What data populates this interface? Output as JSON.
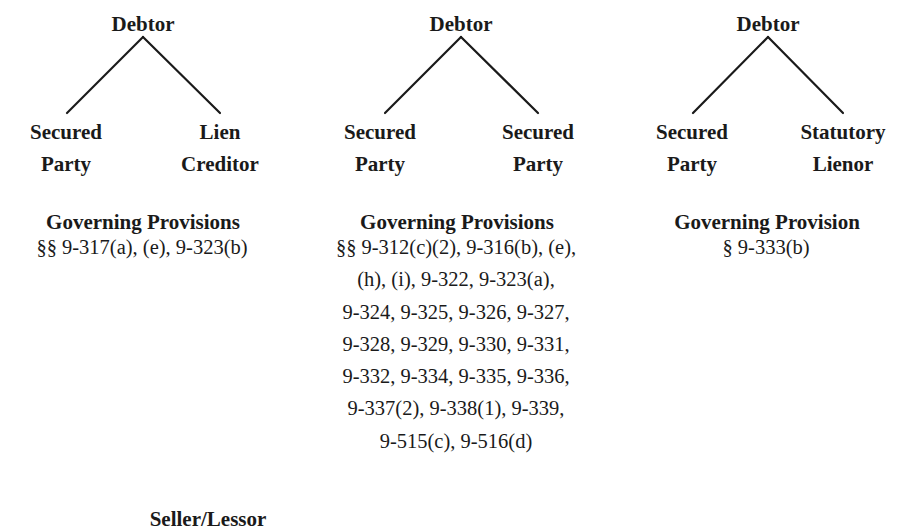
{
  "diagrams": [
    {
      "root": "Debtor",
      "left_child": [
        "Secured",
        "Party"
      ],
      "right_child": [
        "Lien",
        "Creditor"
      ],
      "provisions_title": "Governing Provisions",
      "provisions_lines": [
        "§§ 9-317(a), (e), 9-323(b)"
      ]
    },
    {
      "root": "Debtor",
      "left_child": [
        "Secured",
        "Party"
      ],
      "right_child": [
        "Secured",
        "Party"
      ],
      "provisions_title": "Governing Provisions",
      "provisions_lines": [
        "§§ 9-312(c)(2), 9-316(b), (e),",
        "(h), (i), 9-322, 9-323(a),",
        "9-324, 9-325, 9-326, 9-327,",
        "9-328, 9-329, 9-330, 9-331,",
        "9-332, 9-334, 9-335, 9-336,",
        "9-337(2), 9-338(1), 9-339,",
        "9-515(c), 9-516(d)"
      ]
    },
    {
      "root": "Debtor",
      "left_child": [
        "Secured",
        "Party"
      ],
      "right_child": [
        "Statutory",
        "Lienor"
      ],
      "provisions_title": "Governing Provision",
      "provisions_lines": [
        "§ 9-333(b)"
      ]
    }
  ],
  "next_diagram": {
    "root": "Seller/Lessor"
  }
}
